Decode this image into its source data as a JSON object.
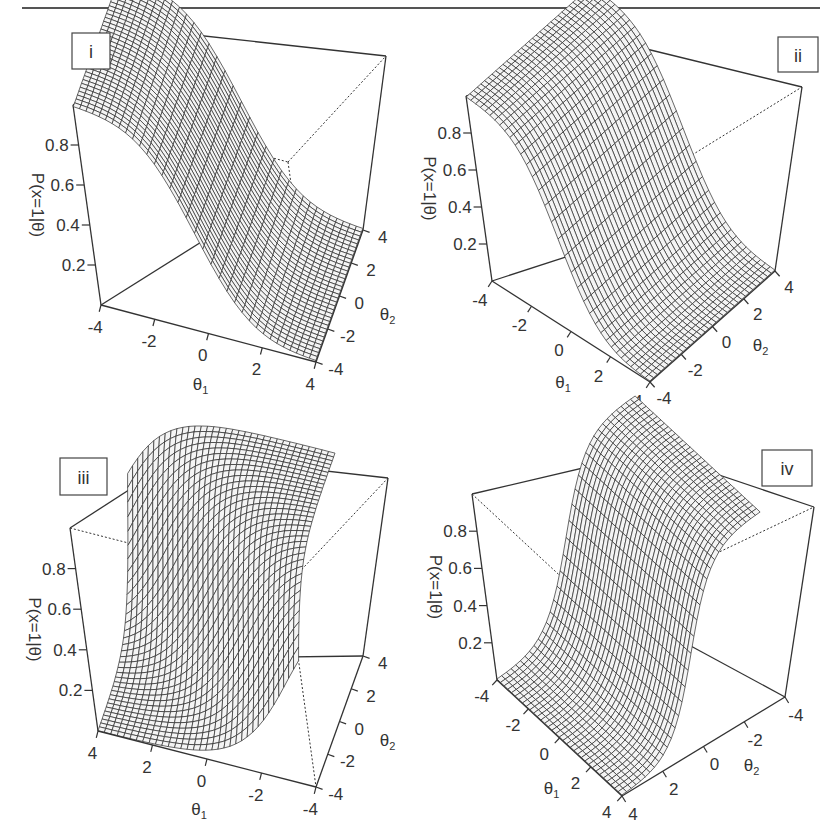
{
  "figure": {
    "top_rule": true
  },
  "chart_data": [
    {
      "type": "surface3d",
      "panel_label": "i",
      "title": "",
      "zlabel": "P(x=1|θ)",
      "xlabel": "θ1",
      "ylabel": "θ2",
      "x_ticks": [
        "-4",
        "-2",
        "0",
        "2",
        "4"
      ],
      "y_ticks": [
        "-4",
        "-2",
        "0",
        "2",
        "4"
      ],
      "z_ticks": [
        "0.2",
        "0.4",
        "0.6",
        "0.8"
      ],
      "x_range": [
        -4,
        4
      ],
      "y_range": [
        -4,
        4
      ],
      "z_range": [
        0,
        1
      ],
      "function": "logistic(a1*θ1 + a2*θ2)",
      "params": {
        "a1": 1.0,
        "a2": 0.0,
        "b": 0
      },
      "description": "S-shaped item response surface rising along θ1, flat along θ2"
    },
    {
      "type": "surface3d",
      "panel_label": "ii",
      "title": "",
      "zlabel": "P(x=1|θ)",
      "xlabel": "θ1",
      "ylabel": "θ2",
      "x_ticks": [
        "-4",
        "-2",
        "0",
        "2",
        "4"
      ],
      "y_ticks": [
        "-4",
        "-2",
        "0",
        "2",
        "4"
      ],
      "z_ticks": [
        "0.2",
        "0.4",
        "0.6",
        "0.8"
      ],
      "x_range": [
        -4,
        4
      ],
      "y_range": [
        -4,
        4
      ],
      "z_range": [
        0,
        1
      ],
      "function": "logistic(a1*θ1 + a2*θ2)",
      "params": {
        "a1": 1.0,
        "a2": 0.0,
        "b": 0
      },
      "description": "Same surface viewed from rotated angle; steep rise along θ1"
    },
    {
      "type": "surface3d",
      "panel_label": "iii",
      "title": "",
      "zlabel": "P(x=1|θ)",
      "xlabel": "θ1",
      "ylabel": "θ2",
      "x_ticks": [
        "4",
        "2",
        "0",
        "-2",
        "-4"
      ],
      "y_ticks": [
        "-4",
        "-2",
        "0",
        "2",
        "4"
      ],
      "z_ticks": [
        "0.2",
        "0.4",
        "0.6",
        "0.8"
      ],
      "x_range": [
        4,
        -4
      ],
      "y_range": [
        -4,
        4
      ],
      "z_range": [
        0,
        1
      ],
      "function": "logistic(a1*θ1 + a2*θ2)",
      "params": {
        "a1": 1.0,
        "a2": 1.0,
        "b": 0
      },
      "description": "Surface rising along both θ1 and θ2 (compensatory), viewed with reversed θ1 axis"
    },
    {
      "type": "surface3d",
      "panel_label": "iv",
      "title": "",
      "zlabel": "P(x=1|θ)",
      "xlabel": "θ1",
      "ylabel": "θ2",
      "x_ticks": [
        "-4",
        "-2",
        "0",
        "2",
        "4"
      ],
      "y_ticks": [
        "4",
        "2",
        "0",
        "-2",
        "-4"
      ],
      "z_ticks": [
        "0.2",
        "0.4",
        "0.6",
        "0.8"
      ],
      "x_range": [
        -4,
        4
      ],
      "y_range": [
        4,
        -4
      ],
      "z_range": [
        0,
        1
      ],
      "function": "logistic(a1*θ1 + a2*θ2)",
      "params": {
        "a1": 0.0,
        "a2": -1.0,
        "b": 0
      },
      "description": "S-shaped surface decreasing along θ2 (high at θ2=-4), flat along θ1"
    }
  ],
  "panels": [
    {
      "label": "i",
      "label_box": [
        72,
        33,
        38,
        36
      ],
      "corners": {
        "bottom_left_front": [
          101,
          305
        ],
        "bottom_right_front": [
          316,
          362
        ],
        "bottom_right_back": [
          363,
          230
        ],
        "top_left_front": [
          73,
          105
        ],
        "top_back_left": [
          186,
          34
        ],
        "top_right_back": [
          386,
          56
        ]
      },
      "axis_text": {
        "z": "P(x=1|θ)",
        "x_main": "θ",
        "x_sub": "1",
        "y_main": "θ",
        "y_sub": "2"
      }
    },
    {
      "label": "ii",
      "label_box": [
        778,
        37,
        40,
        35
      ],
      "corners": {
        "bottom_left_front": [
          492,
          281
        ],
        "bottom_right_front": [
          650,
          382
        ],
        "bottom_right_back": [
          775,
          271
        ],
        "top_left_front": [
          466,
          96
        ],
        "top_back_left": [
          626,
          44
        ],
        "top_right_back": [
          802,
          87
        ]
      },
      "axis_text": {
        "z": "P(x=1|θ)",
        "x_main": "θ",
        "x_sub": "1",
        "y_main": "θ",
        "y_sub": "2"
      }
    },
    {
      "label": "iii",
      "label_box": [
        60,
        458,
        47,
        37
      ],
      "corners": {
        "bottom_left_front": [
          98,
          731
        ],
        "bottom_right_front": [
          316,
          787
        ],
        "bottom_right_back": [
          363,
          656
        ],
        "top_left_front": [
          70,
          528
        ],
        "top_back_left": [
          183,
          455
        ],
        "top_right_back": [
          388,
          478
        ]
      },
      "axis_text": {
        "z": "P(x=1|θ)",
        "x_main": "θ",
        "x_sub": "1",
        "y_main": "θ",
        "y_sub": "2"
      }
    },
    {
      "label": "iv",
      "label_box": [
        762,
        450,
        50,
        36
      ],
      "corners": {
        "bottom_left_front": [
          497,
          680
        ],
        "bottom_right_front": [
          622,
          796
        ],
        "bottom_right_back": [
          785,
          697
        ],
        "top_left_front": [
          472,
          494
        ],
        "top_back_left": [
          651,
          452
        ],
        "top_right_back": [
          814,
          507
        ]
      },
      "axis_text": {
        "z": "P(x=1|θ)",
        "x_main": "θ",
        "x_sub": "1",
        "y_main": "θ",
        "y_sub": "2"
      }
    }
  ]
}
